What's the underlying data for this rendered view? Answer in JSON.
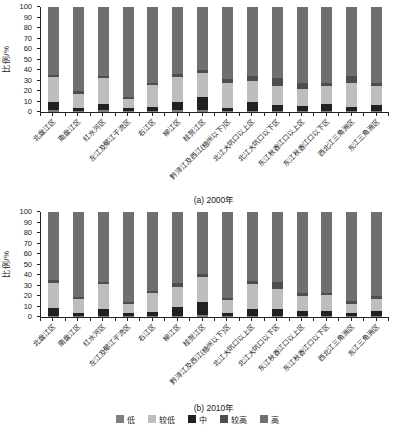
{
  "figure": {
    "ylabel": "比例/%",
    "yticks": [
      0,
      10,
      20,
      30,
      40,
      50,
      60,
      70,
      80,
      90,
      100
    ],
    "legend": [
      {
        "label": "低",
        "color": "#7f7f7f"
      },
      {
        "label": "较低",
        "color": "#bdbdbd"
      },
      {
        "label": "中",
        "color": "#212121"
      },
      {
        "label": "较高",
        "color": "#4e4e4e"
      },
      {
        "label": "高",
        "color": "#6f6f6f"
      }
    ],
    "stack_order": [
      "低",
      "中",
      "较低",
      "较高",
      "高"
    ],
    "panels": [
      {
        "caption": "(a) 2000年"
      },
      {
        "caption": "(b) 2010年"
      }
    ]
  },
  "chart_data": [
    {
      "type": "bar",
      "stacked": true,
      "title": "(a) 2000年",
      "ylabel": "比例/%",
      "ylim": [
        0,
        100
      ],
      "grid": false,
      "legend_position": "bottom",
      "categories": [
        "北盘江区",
        "南盘江区",
        "红水河区",
        "左江及郁江干流区",
        "右江区",
        "柳江区",
        "桂贺江区",
        "黔浔江及西江(梧州以下)区",
        "北江大坑口以上区",
        "北江大坑口以下区",
        "东江秋香江口以上区",
        "东江秋香江口以下区",
        "西北江三角洲区",
        "东江三角洲区"
      ],
      "series": [
        {
          "name": "低",
          "values": [
            2,
            1,
            2,
            1,
            1,
            2,
            2,
            1,
            1,
            1,
            1,
            1,
            1,
            1
          ]
        },
        {
          "name": "较低",
          "values": [
            23,
            13,
            24,
            8,
            21,
            23,
            23,
            24,
            20,
            18,
            16,
            17,
            23,
            18
          ]
        },
        {
          "name": "中",
          "values": [
            8,
            3,
            6,
            3,
            4,
            8,
            12,
            3,
            9,
            6,
            5,
            7,
            4,
            6
          ]
        },
        {
          "name": "较高",
          "values": [
            2,
            3,
            2,
            2,
            2,
            3,
            3,
            3,
            4,
            7,
            6,
            3,
            6,
            3
          ]
        },
        {
          "name": "高",
          "values": [
            65,
            80,
            66,
            86,
            72,
            64,
            60,
            69,
            66,
            68,
            72,
            72,
            66,
            72
          ]
        }
      ]
    },
    {
      "type": "bar",
      "stacked": true,
      "title": "(b) 2010年",
      "ylabel": "比例/%",
      "ylim": [
        0,
        100
      ],
      "grid": false,
      "legend_position": "bottom",
      "categories": [
        "北盘江区",
        "南盘江区",
        "红水河区",
        "左江及郁江干流区",
        "右江区",
        "柳江区",
        "桂贺江区",
        "黔浔江及西江(梧州以下)区",
        "北江大坑口以上区",
        "北江大坑口以下区",
        "东江秋香江口以上区",
        "东江秋香江口以下区",
        "西北江三角洲区",
        "东江三角洲区"
      ],
      "series": [
        {
          "name": "低",
          "values": [
            1,
            1,
            1,
            1,
            1,
            1,
            2,
            1,
            1,
            1,
            1,
            1,
            1,
            1
          ]
        },
        {
          "name": "较低",
          "values": [
            23,
            13,
            23,
            8,
            18,
            19,
            24,
            12,
            23,
            19,
            14,
            15,
            8,
            11
          ]
        },
        {
          "name": "中",
          "values": [
            8,
            3,
            7,
            3,
            4,
            9,
            12,
            3,
            7,
            7,
            5,
            5,
            3,
            5
          ]
        },
        {
          "name": "较高",
          "values": [
            3,
            2,
            2,
            2,
            2,
            3,
            3,
            2,
            3,
            6,
            3,
            2,
            3,
            3
          ]
        },
        {
          "name": "高",
          "values": [
            65,
            81,
            67,
            86,
            75,
            68,
            59,
            82,
            66,
            67,
            77,
            77,
            85,
            80
          ]
        }
      ]
    }
  ]
}
